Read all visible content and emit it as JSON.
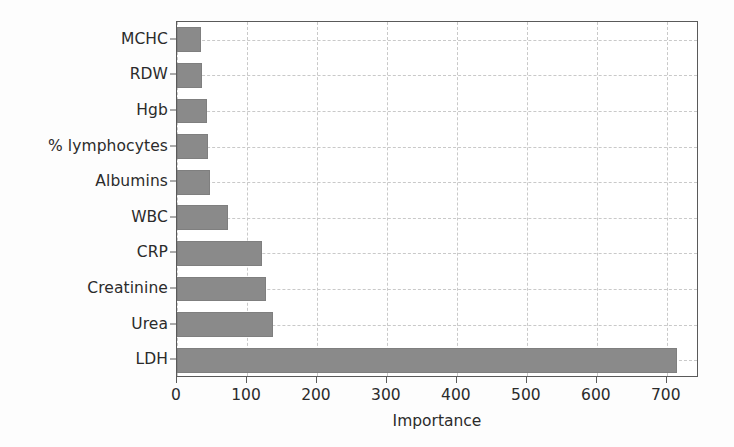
{
  "chart_data": {
    "type": "bar",
    "orientation": "horizontal",
    "title": "",
    "xlabel": "Importance",
    "ylabel": "",
    "categories": [
      "LDH",
      "Urea",
      "Creatinine",
      "CRP",
      "WBC",
      "Albumins",
      "% lymphocytes",
      "Hgb",
      "RDW",
      "MCHC"
    ],
    "values": [
      714,
      137,
      127,
      122,
      73,
      47,
      44,
      43,
      36,
      35
    ],
    "xlim": [
      0,
      746
    ],
    "ylim": [
      0,
      10
    ],
    "xticks": [
      0,
      100,
      200,
      300,
      400,
      500,
      600,
      700
    ],
    "xticklabels": [
      "0",
      "100",
      "200",
      "300",
      "400",
      "500",
      "600",
      "700"
    ],
    "grid": true,
    "grid_style": "dashed",
    "legend": false,
    "bar_color": "#8a8a8a",
    "axis_color": "#5a5a5a",
    "grid_color": "#c9c9c9",
    "background": "#ffffff"
  },
  "axis": {
    "x_title": "Importance"
  }
}
